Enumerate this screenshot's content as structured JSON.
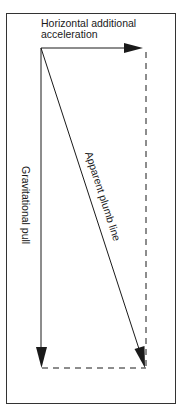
{
  "diagram": {
    "title_line1": "Horizontal additional",
    "title_line2": "acceleration",
    "vertical_label": "Gravitational pull",
    "diagonal_label": "Apparent plumb line",
    "colors": {
      "stroke": "#1a1a1a",
      "frame": "#333333",
      "background": "#ffffff"
    }
  }
}
